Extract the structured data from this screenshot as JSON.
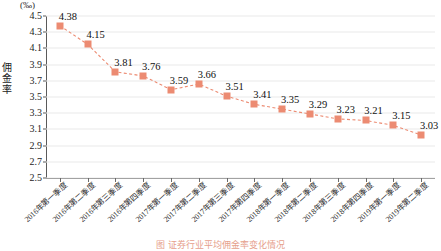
{
  "chart_data": {
    "type": "line",
    "title": "",
    "unit_label": "(‰)",
    "ylabel": "佣金率",
    "xlabel": "",
    "grid": true,
    "legend_position": "none",
    "marker": "square",
    "line_style": "dashed",
    "series_color": "#ec8b72",
    "ylim": [
      2.5,
      4.5
    ],
    "ytick_step": 0.2,
    "yticks": [
      "4.5",
      "4.3",
      "4.1",
      "3.9",
      "3.7",
      "3.5",
      "3.3",
      "3.1",
      "2.9",
      "2.7",
      "2.5"
    ],
    "categories": [
      "2016年第一季度",
      "2016年第二季度",
      "2016年第三季度",
      "2016年第四季度",
      "2017年第一季度",
      "2017年第二季度",
      "2017年第三季度",
      "2017年第四季度",
      "2018年第一季度",
      "2018年第二季度",
      "2018年第三季度",
      "2018年第四季度",
      "2019年第一季度",
      "2019年第二季度"
    ],
    "values": [
      4.38,
      4.15,
      3.81,
      3.76,
      3.59,
      3.66,
      3.51,
      3.41,
      3.35,
      3.29,
      3.23,
      3.21,
      3.15,
      3.03
    ],
    "data_labels": [
      "4.38",
      "4.15",
      "3.81",
      "3.76",
      "3.59",
      "3.66",
      "3.51",
      "3.41",
      "3.35",
      "3.29",
      "3.23",
      "3.21",
      "3.15",
      "3.03"
    ]
  },
  "caption": {
    "text": "图 证券行业平均佣金率变化情况"
  }
}
